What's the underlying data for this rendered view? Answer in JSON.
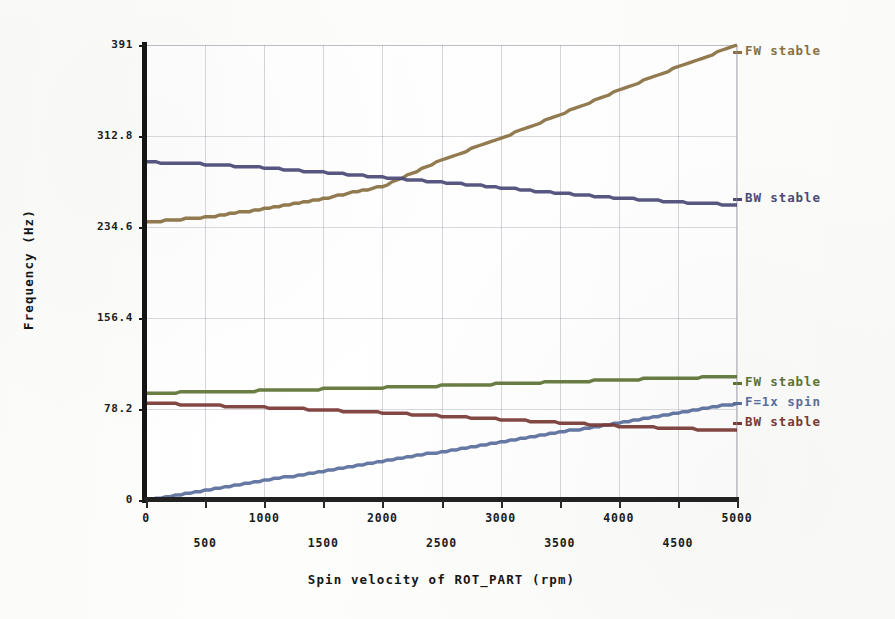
{
  "chart_data": {
    "type": "line",
    "title": "",
    "xlabel": "Spin velocity of ROT_PART (rpm)",
    "ylabel": "Frequency (Hz)",
    "xlim": [
      0,
      5000
    ],
    "ylim": [
      0,
      391
    ],
    "grid": true,
    "legend_position": "right-inline",
    "x_ticks": [
      {
        "value": 0,
        "label": "0",
        "row": "major"
      },
      {
        "value": 500,
        "label": "500",
        "row": "minor"
      },
      {
        "value": 1000,
        "label": "1000",
        "row": "major"
      },
      {
        "value": 1500,
        "label": "1500",
        "row": "minor"
      },
      {
        "value": 2000,
        "label": "2000",
        "row": "major"
      },
      {
        "value": 2500,
        "label": "2500",
        "row": "minor"
      },
      {
        "value": 3000,
        "label": "3000",
        "row": "major"
      },
      {
        "value": 3500,
        "label": "3500",
        "row": "minor"
      },
      {
        "value": 4000,
        "label": "4000",
        "row": "major"
      },
      {
        "value": 4500,
        "label": "4500",
        "row": "minor"
      },
      {
        "value": 5000,
        "label": "5000",
        "row": "major"
      }
    ],
    "y_ticks": [
      {
        "value": 0,
        "label": "0"
      },
      {
        "value": 78.2,
        "label": "78.2"
      },
      {
        "value": 156.4,
        "label": "156.4"
      },
      {
        "value": 234.6,
        "label": "234.6"
      },
      {
        "value": 312.8,
        "label": "312.8"
      },
      {
        "value": 391,
        "label": "391"
      }
    ],
    "x": [
      0,
      500,
      1000,
      1500,
      2000,
      2500,
      3000,
      3500,
      4000,
      4500,
      5000
    ],
    "series": [
      {
        "name": "FW stable",
        "label": "FW stable",
        "color": "#8a7142",
        "label_y": 44,
        "values": [
          238.6,
          243.0,
          250.0,
          259.0,
          269.5,
          292.0,
          311.0,
          331.0,
          352.0,
          372.0,
          391.0
        ]
      },
      {
        "name": "BW stable",
        "label": "BW stable",
        "color": "#4b4a78",
        "label_y": 191,
        "values": [
          290.5,
          288.5,
          285.5,
          281.5,
          277.5,
          273.0,
          268.5,
          263.5,
          259.5,
          256.0,
          253.5
        ]
      },
      {
        "name": "FW stable (low)",
        "label": "FW stable",
        "color": "#5f7334",
        "label_y": 375,
        "values": [
          91.8,
          92.8,
          94.0,
          95.3,
          96.6,
          98.2,
          99.8,
          101.5,
          103.2,
          104.8,
          106.0
        ]
      },
      {
        "name": "F=1x spin",
        "label": "F=1x spin",
        "color": "#5a6f9e",
        "label_y": 395,
        "values": [
          0,
          8.3,
          16.6,
          24.9,
          33.2,
          41.5,
          49.8,
          58.1,
          66.4,
          74.7,
          83.0
        ]
      },
      {
        "name": "BW stable (low)",
        "label": "BW stable",
        "color": "#7a3a36",
        "label_y": 415,
        "values": [
          83.3,
          81.5,
          79.6,
          77.4,
          75.0,
          72.2,
          69.4,
          66.4,
          63.6,
          61.4,
          59.8
        ]
      }
    ],
    "annotations": {
      "crossing_note": "F=1x spin crosses BW stable (low) near 3900 rpm"
    }
  },
  "colors": {
    "fw_stable_upper": "#8a7142",
    "bw_stable_upper": "#4b4a78",
    "fw_stable_lower": "#5f7334",
    "one_x_spin": "#5a6f9e",
    "bw_stable_lower": "#7a3a36",
    "axis": "#1b1b1b",
    "grid": "#96969f",
    "background": "#ffffff"
  }
}
